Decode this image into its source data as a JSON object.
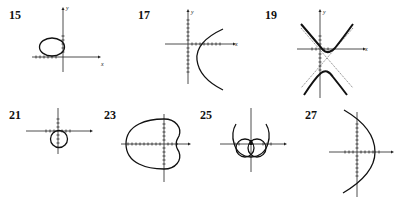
{
  "figure": {
    "panels": [
      {
        "id": "15",
        "label": "15",
        "curve": "ellipse-left-of-origin",
        "x_axis": "x",
        "y_axis": "y"
      },
      {
        "id": "17",
        "label": "17",
        "curve": "parabola-opening-right",
        "x_axis": "x",
        "y_axis": "y"
      },
      {
        "id": "19",
        "label": "19",
        "curve": "hyperbola-vertical-with-asymptotes",
        "x_axis": "x",
        "y_axis": "y"
      },
      {
        "id": "21",
        "label": "21",
        "curve": "circle-below-origin"
      },
      {
        "id": "23",
        "label": "23",
        "curve": "cardioid-opening-left"
      },
      {
        "id": "25",
        "label": "25",
        "curve": "limacon-inner-loop"
      },
      {
        "id": "27",
        "label": "27",
        "curve": "parabola-opening-left"
      }
    ]
  }
}
